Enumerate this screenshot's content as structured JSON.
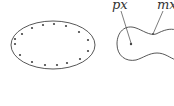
{
  "figure": {
    "left_panel": {
      "shape": "ellipse",
      "dot_count": 16
    },
    "right_panel": {
      "shape": "peanut-curve",
      "labels": {
        "px": "px",
        "mx": "mx"
      }
    },
    "colors": {
      "stroke": "#444444",
      "background": "#ffffff"
    }
  }
}
